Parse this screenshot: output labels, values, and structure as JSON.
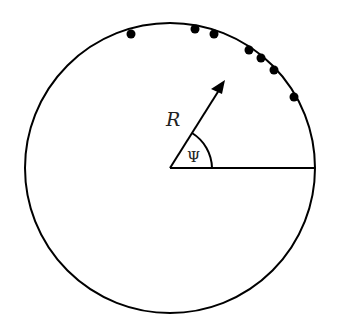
{
  "diagram": {
    "labels": {
      "radius": "R",
      "angle": "Ψ"
    },
    "circle": {
      "cx": 170,
      "cy": 168,
      "r": 145
    },
    "points": [
      {
        "x": 131,
        "y": 34
      },
      {
        "x": 195,
        "y": 29
      },
      {
        "x": 214,
        "y": 34
      },
      {
        "x": 249,
        "y": 50
      },
      {
        "x": 261,
        "y": 58
      },
      {
        "x": 274,
        "y": 70
      },
      {
        "x": 294,
        "y": 97
      }
    ],
    "colors": {
      "stroke": "#000000",
      "background": "#ffffff"
    }
  }
}
